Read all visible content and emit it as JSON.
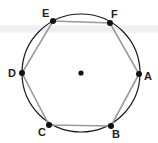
{
  "diagram": {
    "type": "inscribed-hexagon",
    "circle": {
      "cx": 81,
      "cy": 73,
      "r": 59,
      "stroke": "#1a1a1a"
    },
    "center_point": {
      "x": 81,
      "y": 73
    },
    "polygon_stroke": "#9a9a9a",
    "vertex_color": "#111111",
    "vertices": [
      {
        "label": "A",
        "x": 139,
        "y": 74,
        "lx": 144,
        "ly": 80
      },
      {
        "label": "B",
        "x": 111,
        "y": 126,
        "lx": 112,
        "ly": 138
      },
      {
        "label": "C",
        "x": 49,
        "y": 125,
        "lx": 38,
        "ly": 136
      },
      {
        "label": "D",
        "x": 22,
        "y": 73,
        "lx": 8,
        "ly": 77
      },
      {
        "label": "E",
        "x": 53,
        "y": 21,
        "lx": 42,
        "ly": 17
      },
      {
        "label": "F",
        "x": 110,
        "y": 23,
        "lx": 111,
        "ly": 18
      }
    ]
  }
}
